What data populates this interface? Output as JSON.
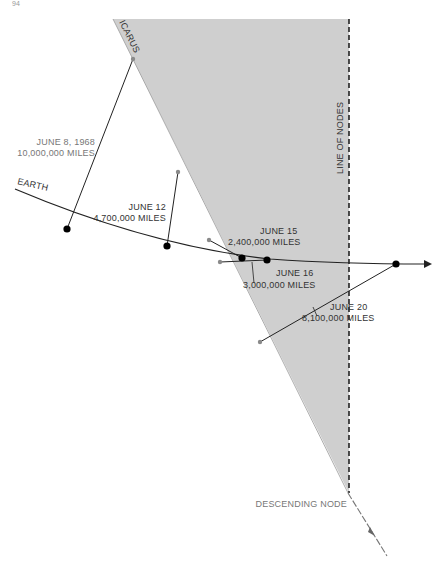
{
  "page_number": "94",
  "diagram": {
    "orbits": {
      "icarus_label": "ICARUS",
      "earth_label": "EARTH"
    },
    "line_of_nodes_label": "LINE OF NODES",
    "descending_node_label": "DESCENDING NODE",
    "positions": [
      {
        "date": "JUNE 8, 1968",
        "distance": "10,000,000 MILES"
      },
      {
        "date": "JUNE 12",
        "distance": "4,700,000 MILES"
      },
      {
        "date": "JUNE 15",
        "distance": "2,400,000 MILES"
      },
      {
        "date": "JUNE 16",
        "distance": "3,000,000 MILES"
      },
      {
        "date": "JUNE 20",
        "distance": "8,100,000 MILES"
      }
    ],
    "colors": {
      "shaded_plane": "#cfcfcf",
      "lines": "#222222",
      "icarus_points": "#8a8a8a",
      "earth_points": "#000000"
    }
  }
}
